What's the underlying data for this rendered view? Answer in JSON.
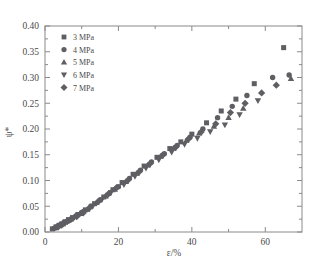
{
  "chart_data": {
    "type": "scatter",
    "title": "",
    "xlabel": "ε/%",
    "ylabel": "ψ*",
    "xlim": [
      0,
      70
    ],
    "ylim": [
      0.0,
      0.4
    ],
    "xticks": [
      0,
      20,
      40,
      60
    ],
    "yticks": [
      "0.00",
      "0.05",
      "0.10",
      "0.15",
      "0.20",
      "0.25",
      "0.30",
      "0.35",
      "0.40"
    ],
    "ytick_values": [
      0.0,
      0.05,
      0.1,
      0.15,
      0.2,
      0.25,
      0.3,
      0.35,
      0.4
    ],
    "xtick_labels": [
      "0",
      "20",
      "40",
      "60"
    ],
    "grid": false,
    "legend_position": "upper-left",
    "minor_ticks": true,
    "marker_color": "#5e5e63",
    "series": [
      {
        "name": "3 MPa",
        "marker": "square",
        "points": [
          [
            2.0,
            0.006
          ],
          [
            3.0,
            0.01
          ],
          [
            3.8,
            0.013
          ],
          [
            4.6,
            0.016
          ],
          [
            5.5,
            0.02
          ],
          [
            6.4,
            0.024
          ],
          [
            7.5,
            0.028
          ],
          [
            9.0,
            0.034
          ],
          [
            11.0,
            0.043
          ],
          [
            13.5,
            0.055
          ],
          [
            16.0,
            0.068
          ],
          [
            18.5,
            0.082
          ],
          [
            21.0,
            0.096
          ],
          [
            24.0,
            0.112
          ],
          [
            27.0,
            0.128
          ],
          [
            30.5,
            0.145
          ],
          [
            34.0,
            0.162
          ],
          [
            37.0,
            0.175
          ],
          [
            40.0,
            0.19
          ],
          [
            44.0,
            0.212
          ],
          [
            48.0,
            0.235
          ],
          [
            52.0,
            0.258
          ],
          [
            57.0,
            0.288
          ],
          [
            65.0,
            0.358
          ]
        ]
      },
      {
        "name": "4 MPa",
        "marker": "circle",
        "points": [
          [
            2.4,
            0.007
          ],
          [
            3.4,
            0.011
          ],
          [
            4.2,
            0.014
          ],
          [
            5.2,
            0.018
          ],
          [
            6.2,
            0.022
          ],
          [
            7.2,
            0.026
          ],
          [
            8.4,
            0.031
          ],
          [
            10.0,
            0.038
          ],
          [
            12.5,
            0.05
          ],
          [
            15.0,
            0.062
          ],
          [
            17.5,
            0.075
          ],
          [
            20.0,
            0.088
          ],
          [
            23.0,
            0.104
          ],
          [
            26.0,
            0.12
          ],
          [
            29.0,
            0.136
          ],
          [
            32.5,
            0.152
          ],
          [
            36.0,
            0.168
          ],
          [
            39.5,
            0.184
          ],
          [
            43.0,
            0.2
          ],
          [
            47.0,
            0.222
          ],
          [
            51.0,
            0.244
          ],
          [
            55.0,
            0.265
          ],
          [
            62.0,
            0.3
          ],
          [
            66.5,
            0.305
          ]
        ]
      },
      {
        "name": "5 MPa",
        "marker": "triangle-up",
        "points": [
          [
            2.8,
            0.008
          ],
          [
            3.9,
            0.012
          ],
          [
            4.9,
            0.016
          ],
          [
            5.9,
            0.021
          ],
          [
            7.0,
            0.025
          ],
          [
            8.2,
            0.03
          ],
          [
            9.6,
            0.036
          ],
          [
            11.5,
            0.044
          ],
          [
            14.0,
            0.057
          ],
          [
            16.5,
            0.07
          ],
          [
            19.0,
            0.083
          ],
          [
            22.0,
            0.098
          ],
          [
            25.0,
            0.114
          ],
          [
            28.0,
            0.13
          ],
          [
            31.5,
            0.147
          ],
          [
            35.0,
            0.163
          ],
          [
            38.5,
            0.178
          ],
          [
            42.0,
            0.192
          ],
          [
            46.0,
            0.205
          ],
          [
            50.0,
            0.222
          ],
          [
            54.0,
            0.24
          ],
          [
            67.0,
            0.298
          ]
        ]
      },
      {
        "name": "6 MPa",
        "marker": "triangle-down",
        "points": [
          [
            3.2,
            0.009
          ],
          [
            4.4,
            0.013
          ],
          [
            5.4,
            0.018
          ],
          [
            6.6,
            0.023
          ],
          [
            7.8,
            0.027
          ],
          [
            9.2,
            0.033
          ],
          [
            10.8,
            0.04
          ],
          [
            13.0,
            0.05
          ],
          [
            15.5,
            0.063
          ],
          [
            18.0,
            0.077
          ],
          [
            21.5,
            0.092
          ],
          [
            24.5,
            0.108
          ],
          [
            27.5,
            0.124
          ],
          [
            31.0,
            0.14
          ],
          [
            34.5,
            0.155
          ],
          [
            38.0,
            0.17
          ],
          [
            41.5,
            0.182
          ],
          [
            45.0,
            0.195
          ],
          [
            49.0,
            0.208
          ],
          [
            53.0,
            0.228
          ],
          [
            58.0,
            0.255
          ]
        ]
      },
      {
        "name": "7 MPa",
        "marker": "diamond",
        "points": [
          [
            3.6,
            0.01
          ],
          [
            4.8,
            0.015
          ],
          [
            6.0,
            0.02
          ],
          [
            7.0,
            0.024
          ],
          [
            8.6,
            0.03
          ],
          [
            10.4,
            0.037
          ],
          [
            12.0,
            0.046
          ],
          [
            14.5,
            0.059
          ],
          [
            17.0,
            0.072
          ],
          [
            19.5,
            0.086
          ],
          [
            22.5,
            0.1
          ],
          [
            25.5,
            0.116
          ],
          [
            28.5,
            0.132
          ],
          [
            32.0,
            0.149
          ],
          [
            35.5,
            0.164
          ],
          [
            39.0,
            0.18
          ],
          [
            42.5,
            0.194
          ],
          [
            46.5,
            0.21
          ],
          [
            50.5,
            0.232
          ],
          [
            54.5,
            0.25
          ],
          [
            59.0,
            0.27
          ],
          [
            63.0,
            0.285
          ]
        ]
      }
    ]
  },
  "legend": {
    "items": [
      {
        "label": "3 MPa",
        "marker": "square"
      },
      {
        "label": "4 MPa",
        "marker": "circle"
      },
      {
        "label": "5 MPa",
        "marker": "triangle-up"
      },
      {
        "label": "6 MPa",
        "marker": "triangle-down"
      },
      {
        "label": "7 MPa",
        "marker": "diamond"
      }
    ]
  }
}
